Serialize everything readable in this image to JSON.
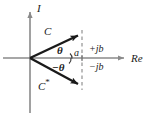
{
  "figure": {
    "background_color": "#ffffff",
    "axis_color": "#8a8a8a",
    "vector_color": "#1a1a1a",
    "dashed_color": "#9a9a9a",
    "width": 155,
    "height": 121
  },
  "axes": {
    "vertical_label": "I",
    "horizontal_label": "Re",
    "origin": {
      "x": 30,
      "y": 58
    }
  },
  "vectors": [
    {
      "label": "C",
      "label_suffix": "",
      "angle_label": "θ",
      "tip": {
        "x": 82,
        "y": 33
      },
      "label_pos": {
        "x": 44,
        "y": 32
      }
    },
    {
      "label": "C",
      "label_suffix": "*",
      "angle_label": "−θ",
      "tip": {
        "x": 82,
        "y": 88
      },
      "label_pos": {
        "x": 40,
        "y": 84
      }
    }
  ],
  "components": {
    "real_label": "a",
    "positive_imag_label": "+jb",
    "negative_imag_label": "−jb",
    "projection_x": 82
  }
}
